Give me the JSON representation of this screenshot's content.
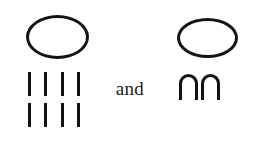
{
  "figure": {
    "background_color": "#ffffff",
    "ink_color": "#131313",
    "conjunction": "and",
    "left_group": {
      "name": "oval-with-tally-marks",
      "top_symbol": "oval",
      "tally_rows": [
        [
          "|",
          "|",
          "|",
          "|"
        ],
        [
          "|",
          "|",
          "|",
          "|"
        ]
      ],
      "tally_total": 8
    },
    "right_group": {
      "name": "oval-with-arches",
      "top_symbol": "oval",
      "arches": [
        "∩",
        "∩"
      ],
      "arch_total": 2
    }
  }
}
